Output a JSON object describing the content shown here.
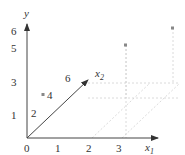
{
  "diagram": {
    "axes": {
      "y_label": "y",
      "x1_label": "x",
      "x1_sub": "1",
      "x2_label": "x",
      "x2_sub": "2"
    },
    "y_ticks": [
      "6",
      "5",
      "3",
      "1"
    ],
    "x1_ticks": [
      "0",
      "1",
      "2",
      "3"
    ],
    "x2_ticks": [
      "2",
      "4",
      "6"
    ],
    "points": [
      {
        "x1": 0,
        "x2": 4,
        "y": 3
      },
      {
        "x1": 2,
        "x2": 6,
        "y": 5
      },
      {
        "x1": 3,
        "x2": 6,
        "y": 6
      }
    ],
    "colors": {
      "axis": "#444444",
      "dashed": "#cccccc",
      "point": "#888888"
    }
  }
}
